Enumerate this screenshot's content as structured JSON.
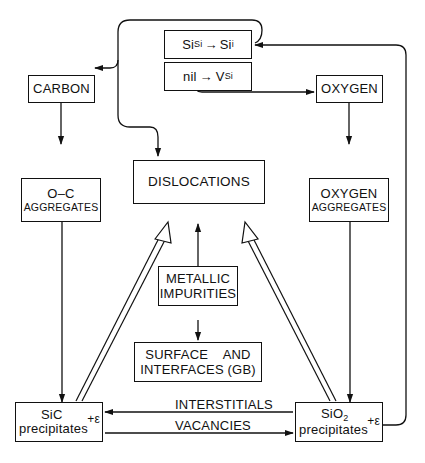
{
  "diagram": {
    "nodes": {
      "si_interstitial": {
        "base": "Si",
        "sub1": "Si",
        "arrow": "→",
        "base2": "Si",
        "sub2": "i"
      },
      "vacancy": {
        "base": "nil",
        "arrow": "→",
        "base2": "V",
        "sub2": "Si"
      },
      "carbon": {
        "label": "CARBON"
      },
      "oxygen": {
        "label": "OXYGEN"
      },
      "oc_aggregates": {
        "line1": "O–C",
        "line2": "AGGREGATES"
      },
      "oxygen_aggregates": {
        "line1": "OXYGEN",
        "line2": "AGGREGATES"
      },
      "dislocations": {
        "label": "DISLOCATIONS"
      },
      "metallic_impurities": {
        "line1": "METALLIC",
        "line2": "IMPURITIES"
      },
      "surface_interfaces": {
        "line1": "SURFACE    AND",
        "line2": "INTERFACES (GB)"
      },
      "sic_precipitates": {
        "line1": "SiC",
        "line2": "precipitates",
        "strain": "+ε"
      },
      "sio2_precipitates": {
        "line1_base": "SiO",
        "line1_sub": "2",
        "line2": "precipitates",
        "strain": "+ε"
      }
    },
    "edge_labels": {
      "interstitials": "INTERSTITIALS",
      "vacancies": "VACANCIES"
    },
    "edges": [
      {
        "from": "sio2_precipitates",
        "to": "si_interstitial",
        "type": "single"
      },
      {
        "from": "si_interstitial",
        "to": "carbon",
        "type": "single"
      },
      {
        "from": "si_interstitial",
        "to": "dislocations",
        "type": "single"
      },
      {
        "from": "vacancy",
        "to": "oxygen",
        "type": "single"
      },
      {
        "from": "carbon",
        "to": "oc_aggregates",
        "type": "single"
      },
      {
        "from": "oxygen",
        "to": "oxygen_aggregates",
        "type": "single"
      },
      {
        "from": "oc_aggregates",
        "to": "sic_precipitates",
        "type": "single"
      },
      {
        "from": "oxygen_aggregates",
        "to": "sio2_precipitates",
        "type": "single"
      },
      {
        "from": "metallic_impurities",
        "to": "dislocations",
        "type": "single"
      },
      {
        "from": "metallic_impurities",
        "to": "surface_interfaces",
        "type": "single"
      },
      {
        "from": "sic_precipitates",
        "to": "dislocations",
        "type": "double"
      },
      {
        "from": "sio2_precipitates",
        "to": "dislocations",
        "type": "double"
      },
      {
        "from": "sio2_precipitates",
        "to": "sic_precipitates",
        "type": "single",
        "label": "INTERSTITIALS"
      },
      {
        "from": "sic_precipitates",
        "to": "sio2_precipitates",
        "type": "single",
        "label": "VACANCIES"
      }
    ]
  }
}
